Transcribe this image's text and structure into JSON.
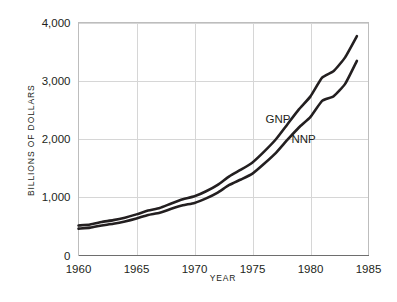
{
  "chart_data": {
    "type": "line",
    "title": "",
    "xlabel": "YEAR",
    "ylabel": "BILLIONS OF DOLLARS",
    "xlim": [
      1960,
      1985
    ],
    "ylim": [
      0,
      4000
    ],
    "grid": true,
    "legend_position": "inline-annotations",
    "x_ticks": [
      "1960",
      "1965",
      "1970",
      "1975",
      "1980",
      "1985"
    ],
    "x_tick_values": [
      1960,
      1965,
      1970,
      1975,
      1980,
      1985
    ],
    "y_ticks": [
      "0",
      "1,000",
      "2,000",
      "3,000",
      "4,000"
    ],
    "y_tick_values": [
      0,
      1000,
      2000,
      3000,
      4000
    ],
    "x": [
      1960,
      1961,
      1962,
      1963,
      1964,
      1965,
      1966,
      1967,
      1968,
      1969,
      1970,
      1971,
      1972,
      1973,
      1974,
      1975,
      1976,
      1977,
      1978,
      1979,
      1980,
      1981,
      1982,
      1983,
      1984
    ],
    "series": [
      {
        "name": "GNP",
        "label": "GNP",
        "color": "#231f20",
        "values": [
          515,
          533,
          575,
          607,
          650,
          706,
          772,
          816,
          893,
          964,
          1016,
          1103,
          1213,
          1359,
          1473,
          1598,
          1783,
          1991,
          2250,
          2508,
          2732,
          3053,
          3166,
          3406,
          3765
        ]
      },
      {
        "name": "NNP",
        "label": "NNP",
        "color": "#231f20",
        "values": [
          461,
          478,
          516,
          545,
          585,
          636,
          695,
          733,
          801,
          861,
          903,
          981,
          1081,
          1211,
          1305,
          1406,
          1574,
          1757,
          1983,
          2198,
          2380,
          2654,
          2735,
          2951,
          3342
        ]
      }
    ],
    "annotations": [
      {
        "text": "GNP",
        "x": 1977.2,
        "y": 2280
      },
      {
        "text": "NNP",
        "x": 1979.4,
        "y": 1930
      }
    ]
  },
  "colors": {
    "background": "#ffffff",
    "line": "#231f20",
    "grid": "#d6d6d6",
    "frame": "#bdbdbd",
    "text": "#231f20"
  }
}
